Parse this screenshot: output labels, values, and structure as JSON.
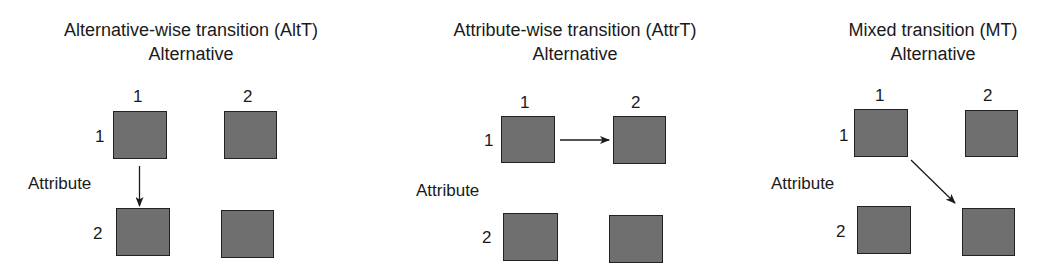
{
  "panels": [
    {
      "title": "Alternative-wise transition (AltT)",
      "axis_top": "Alternative",
      "axis_left": "Attribute",
      "columns": [
        "1",
        "2"
      ],
      "rows": [
        "1",
        "2"
      ],
      "transition": {
        "from": [
          1,
          1
        ],
        "to": [
          2,
          1
        ],
        "direction": "down"
      }
    },
    {
      "title": "Attribute-wise transition (AttrT)",
      "axis_top": "Alternative",
      "axis_left": "Attribute",
      "columns": [
        "1",
        "2"
      ],
      "rows": [
        "1",
        "2"
      ],
      "transition": {
        "from": [
          1,
          1
        ],
        "to": [
          1,
          2
        ],
        "direction": "right"
      }
    },
    {
      "title": "Mixed transition (MT)",
      "axis_top": "Alternative",
      "axis_left": "Attribute",
      "columns": [
        "1",
        "2"
      ],
      "rows": [
        "1",
        "2"
      ],
      "transition": {
        "from": [
          1,
          1
        ],
        "to": [
          2,
          2
        ],
        "direction": "diagonal"
      }
    }
  ],
  "colors": {
    "box_fill": "#6f6f6f",
    "box_border": "#222222",
    "arrow": "#1a1a1a",
    "text": "#1a1a1a"
  }
}
